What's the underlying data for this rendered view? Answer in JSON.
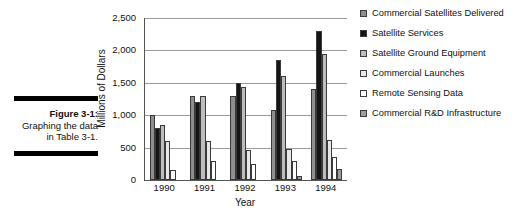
{
  "caption": {
    "title": "Figure 3-1:",
    "body": "Graphing the data in Table 3-1."
  },
  "chart_data": {
    "type": "bar",
    "title": "",
    "xlabel": "Year",
    "ylabel": "Millions of Dollars",
    "categories": [
      "1990",
      "1991",
      "1992",
      "1993",
      "1994"
    ],
    "ylim": [
      0,
      2500
    ],
    "yticks": [
      0,
      500,
      1000,
      1500,
      2000,
      2500
    ],
    "ytick_labels": [
      "0",
      "500",
      "1,000",
      "1,500",
      "2,000",
      "2,500"
    ],
    "grid": true,
    "legend_position": "right",
    "series": [
      {
        "name": "Commercial Satellites Delivered",
        "color": "#8f8f8f",
        "values": [
          1000,
          1300,
          1300,
          1080,
          1410
        ]
      },
      {
        "name": "Satellite Services",
        "color": "#151515",
        "values": [
          800,
          1200,
          1500,
          1850,
          2300
        ]
      },
      {
        "name": "Satellite Ground Equipment",
        "color": "#bdbdbd",
        "values": [
          850,
          1300,
          1440,
          1600,
          1950
        ]
      },
      {
        "name": "Commercial Launches",
        "color": "#e8e8e8",
        "values": [
          600,
          600,
          460,
          480,
          620
        ]
      },
      {
        "name": "Remote Sensing Data",
        "color": "#ffffff",
        "values": [
          150,
          300,
          240,
          300,
          360
        ]
      },
      {
        "name": "Commercial R&D Infrastructure",
        "color": "#9c9c9c",
        "values": [
          0,
          0,
          0,
          60,
          170
        ]
      }
    ]
  }
}
